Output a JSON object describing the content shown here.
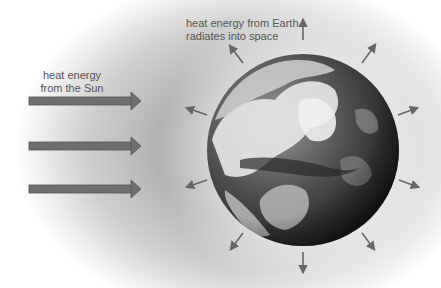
{
  "diagram": {
    "labels": {
      "sun": "heat energy\nfrom the Sun",
      "earth": "heat energy from Earth\nradiates into space"
    },
    "incoming_arrows": [
      {
        "name": "sun-arrow-1",
        "y": 101
      },
      {
        "name": "sun-arrow-2",
        "y": 146
      },
      {
        "name": "sun-arrow-3",
        "y": 189
      }
    ],
    "outgoing_arrows": [
      {
        "name": "radiate-up",
        "angle": -90
      },
      {
        "name": "radiate-upper-right",
        "angle": -60
      },
      {
        "name": "radiate-right-upper",
        "angle": -20
      },
      {
        "name": "radiate-right-lower",
        "angle": 20
      },
      {
        "name": "radiate-lower-right",
        "angle": 55
      },
      {
        "name": "radiate-down",
        "angle": 90
      },
      {
        "name": "radiate-lower-left",
        "angle": 122
      },
      {
        "name": "radiate-left-lower",
        "angle": 162
      },
      {
        "name": "radiate-left-upper",
        "angle": 198
      },
      {
        "name": "radiate-upper-left",
        "angle": 238
      }
    ],
    "colors": {
      "arrow_fill": "#6e6e6e",
      "arrow_stroke": "#555555",
      "text": "#555555",
      "space_glow": "#b0b0b0"
    }
  }
}
